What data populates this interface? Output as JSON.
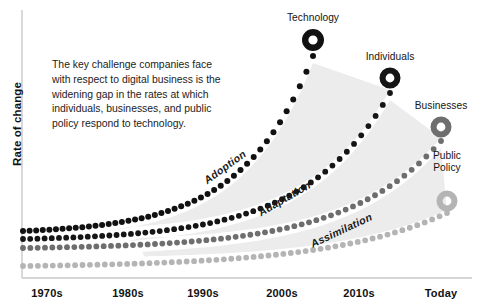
{
  "axes": {
    "y_title": "Rate of change",
    "x_ticks": [
      {
        "label": "1970s",
        "x": 47
      },
      {
        "label": "1980s",
        "x": 128
      },
      {
        "label": "1990s",
        "x": 203
      },
      {
        "label": "2000s",
        "x": 282
      },
      {
        "label": "2010s",
        "x": 359
      },
      {
        "label": "Today",
        "x": 441
      }
    ],
    "axis_color": "#c9c9c9",
    "plot_left": 23,
    "plot_right": 472,
    "plot_top": 10,
    "plot_bottom": 278
  },
  "annotation": {
    "text": "The key challenge companies face with respect to digital business is the widening gap in the rates at which individuals, businesses, and public policy respond to technology."
  },
  "chart_data": {
    "type": "line",
    "title": "",
    "subtitle": "",
    "xlabel": "",
    "ylabel": "Rate of change",
    "xlim": [
      "1970s",
      "Today"
    ],
    "ylim": [
      0,
      1
    ],
    "grid": false,
    "legend": "endpoint-labels",
    "note": "Dotted exponential curves; marker donut at each series endpoint; light gray wedges fill the widening gaps between adjacent curves.",
    "categories": [
      "1970s",
      "1980s",
      "1990s",
      "2000s",
      "2010s",
      "Today"
    ],
    "series": [
      {
        "name": "Technology",
        "color": "#111111",
        "end_label": "Technology",
        "marker": "donut",
        "marker_x": 313,
        "marker_y": 40,
        "marker_r_outer": 11,
        "marker_r_inner": 4.6,
        "start_x": 23,
        "start_y": 231,
        "end_x": 313,
        "end_y": 56,
        "curvature": 4.1,
        "dot_r": 3.0,
        "dot_count": 45,
        "values": [
          0.18,
          0.24,
          0.35,
          0.62,
          0.88,
          1.0
        ]
      },
      {
        "name": "Individuals",
        "color": "#151515",
        "end_label": "Individuals",
        "marker": "donut",
        "marker_x": 390,
        "marker_y": 78,
        "marker_r_outer": 10.5,
        "marker_r_inner": 4.4,
        "start_x": 23,
        "start_y": 239,
        "end_x": 390,
        "end_y": 93,
        "curvature": 4.3,
        "dot_r": 2.9,
        "dot_count": 52,
        "values": [
          0.14,
          0.18,
          0.26,
          0.44,
          0.7,
          0.92
        ]
      },
      {
        "name": "Businesses",
        "color": "#6e6e6e",
        "end_label": "Businesses",
        "marker": "donut",
        "marker_x": 441,
        "marker_y": 127,
        "marker_r_outer": 10.5,
        "marker_r_inner": 4.4,
        "start_x": 23,
        "start_y": 248,
        "end_x": 441,
        "end_y": 141,
        "curvature": 4.4,
        "dot_r": 2.9,
        "dot_count": 58,
        "values": [
          0.1,
          0.13,
          0.18,
          0.3,
          0.5,
          0.74
        ]
      },
      {
        "name": "Public Policy",
        "color": "#b4b4b4",
        "end_label": "Public\nPolicy",
        "marker": "donut",
        "marker_x": 447,
        "marker_y": 201,
        "marker_r_outer": 10.5,
        "marker_r_inner": 4.4,
        "start_x": 23,
        "start_y": 266,
        "end_x": 447,
        "end_y": 213,
        "curvature": 3.6,
        "dot_r": 2.9,
        "dot_count": 58,
        "values": [
          0.04,
          0.05,
          0.08,
          0.14,
          0.26,
          0.44
        ]
      }
    ],
    "bands": [
      {
        "name": "Adoption",
        "between": [
          "Technology",
          "Individuals"
        ],
        "label": "Adoption",
        "label_x": 205,
        "label_y": 175,
        "angle": -36,
        "fill": "#ececec"
      },
      {
        "name": "Adaptation",
        "between": [
          "Individuals",
          "Businesses"
        ],
        "label": "Adaptation",
        "label_x": 259,
        "label_y": 207,
        "angle": -30,
        "fill": "#ececec"
      },
      {
        "name": "Assimilation",
        "between": [
          "Businesses",
          "Public Policy"
        ],
        "label": "Assimilation",
        "label_x": 311,
        "label_y": 238,
        "angle": -25,
        "fill": "#ececec"
      }
    ]
  }
}
